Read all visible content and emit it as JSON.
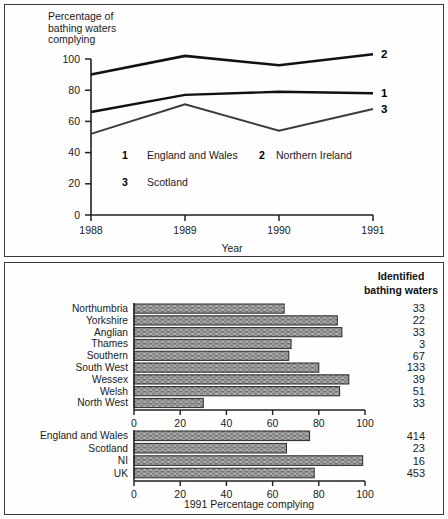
{
  "figure": {
    "background_color": "#fdfdfb",
    "border_color": "#3a3a3a"
  },
  "line_chart": {
    "ylabel": "Percentage of\nbathing waters\ncomplying",
    "xlabel": "Year",
    "legend": [
      {
        "key": "1",
        "label": "England and Wales"
      },
      {
        "key": "2",
        "label": "Northern Ireland"
      },
      {
        "key": "3",
        "label": "Scotland"
      }
    ],
    "end_labels": [
      "2",
      "1",
      "3"
    ],
    "y_ticks": [
      "0",
      "20",
      "40",
      "60",
      "80",
      "100"
    ],
    "x_ticks": [
      "1988",
      "1989",
      "1990",
      "1991"
    ]
  },
  "bar_chart": {
    "header": "Identified\nbathing waters",
    "header_line1": "Identified",
    "header_line2": "bathing waters",
    "xlabel": "1991 Percentage complying",
    "x_ticks": [
      "0",
      "20",
      "40",
      "60",
      "80",
      "100"
    ],
    "bar_fill": "#9a9a9a",
    "bar_edge": "#2b2b2b"
  },
  "chart_data": [
    {
      "type": "line",
      "title": "",
      "xlabel": "Year",
      "ylabel": "Percentage of bathing waters complying",
      "x": [
        "1988",
        "1989",
        "1990",
        "1991"
      ],
      "ylim": [
        0,
        100
      ],
      "xlim": [
        "1988",
        "1991"
      ],
      "grid": false,
      "legend_position": "inside-lower-left",
      "series": [
        {
          "name": "England and Wales",
          "key": "1",
          "values": [
            66,
            77,
            79,
            78
          ]
        },
        {
          "name": "Northern Ireland",
          "key": "2",
          "values": [
            90,
            102,
            96,
            103
          ]
        },
        {
          "name": "Scotland",
          "key": "3",
          "values": [
            52,
            71,
            54,
            68
          ]
        }
      ],
      "annotations": [
        "1",
        "2",
        "3"
      ]
    },
    {
      "type": "bar",
      "orientation": "horizontal",
      "title": "",
      "xlabel": "1991 Percentage complying",
      "ylabel": "",
      "xlim": [
        0,
        100
      ],
      "grid": false,
      "group": "regions",
      "categories": [
        "Northumbria",
        "Yorkshire",
        "Anglian",
        "Thames",
        "Southern",
        "South West",
        "Wessex",
        "Welsh",
        "North West"
      ],
      "values": [
        65,
        88,
        90,
        68,
        67,
        80,
        93,
        89,
        30
      ],
      "side_column_header": "Identified bathing waters",
      "side_values": [
        33,
        22,
        33,
        3,
        67,
        133,
        39,
        51,
        33
      ]
    },
    {
      "type": "bar",
      "orientation": "horizontal",
      "title": "",
      "xlabel": "1991 Percentage complying",
      "ylabel": "",
      "xlim": [
        0,
        100
      ],
      "grid": false,
      "group": "nations",
      "categories": [
        "England and Wales",
        "Scotland",
        "NI",
        "UK"
      ],
      "values": [
        76,
        66,
        99,
        78
      ],
      "side_column_header": "Identified bathing waters",
      "side_values": [
        414,
        23,
        16,
        453
      ]
    }
  ]
}
